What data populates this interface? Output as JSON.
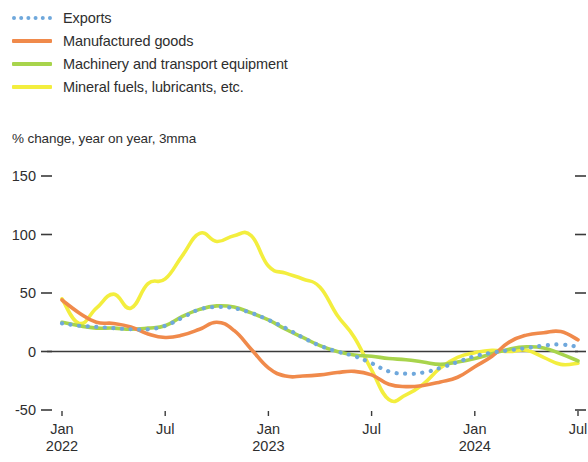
{
  "legend": {
    "items": [
      {
        "label": "Exports",
        "color": "#6FA8DC",
        "style": "dotted"
      },
      {
        "label": "Manufactured goods",
        "color": "#F08A4B",
        "style": "solid"
      },
      {
        "label": "Machinery and transport equipment",
        "color": "#A8D44C",
        "style": "solid"
      },
      {
        "label": "Mineral fuels, lubricants, etc.",
        "color": "#F3EE3E",
        "style": "solid"
      }
    ]
  },
  "subtitle": "% change, year on year, 3mma",
  "axes": {
    "y_ticks": [
      "150",
      "100",
      "50",
      "0",
      "-50"
    ],
    "x_ticks": [
      {
        "month": "Jan",
        "year": "2022"
      },
      {
        "month": "Jul",
        "year": ""
      },
      {
        "month": "Jan",
        "year": "2023"
      },
      {
        "month": "Jul",
        "year": ""
      },
      {
        "month": "Jan",
        "year": "2024"
      },
      {
        "month": "Jul",
        "year": ""
      }
    ]
  },
  "chart_data": {
    "type": "line",
    "title": "",
    "subtitle": "% change, year on year, 3mma",
    "xlabel": "",
    "ylabel": "% change, year on year, 3mma",
    "ylim": [
      -50,
      150
    ],
    "yticks": [
      -50,
      0,
      50,
      100,
      150
    ],
    "grid": false,
    "zero_line": true,
    "legend_position": "top-left",
    "x": [
      "2022-01",
      "2022-02",
      "2022-03",
      "2022-04",
      "2022-05",
      "2022-06",
      "2022-07",
      "2022-08",
      "2022-09",
      "2022-10",
      "2022-11",
      "2022-12",
      "2023-01",
      "2023-02",
      "2023-03",
      "2023-04",
      "2023-05",
      "2023-06",
      "2023-07",
      "2023-08",
      "2023-09",
      "2023-10",
      "2023-11",
      "2023-12",
      "2024-01",
      "2024-02",
      "2024-03",
      "2024-04",
      "2024-05",
      "2024-06",
      "2024-07"
    ],
    "x_tick_labels": [
      "Jan 2022",
      "Jul",
      "Jan 2023",
      "Jul",
      "Jan 2024",
      "Jul"
    ],
    "series": [
      {
        "name": "Exports",
        "color": "#6FA8DC",
        "style": "dotted",
        "values": [
          24,
          22,
          21,
          20,
          19,
          19,
          22,
          29,
          36,
          38,
          37,
          33,
          27,
          20,
          12,
          5,
          0,
          -4,
          -10,
          -17,
          -19,
          -18,
          -14,
          -9,
          -4,
          -1,
          1,
          3,
          5,
          6,
          4
        ]
      },
      {
        "name": "Manufactured goods",
        "color": "#F08A4B",
        "style": "solid",
        "values": [
          44,
          33,
          25,
          24,
          21,
          15,
          12,
          14,
          19,
          25,
          18,
          2,
          -14,
          -21,
          -21,
          -20,
          -18,
          -17,
          -20,
          -28,
          -30,
          -29,
          -26,
          -22,
          -13,
          -4,
          8,
          14,
          16,
          17,
          10
        ]
      },
      {
        "name": "Machinery and transport equipment",
        "color": "#A8D44C",
        "style": "solid",
        "values": [
          25,
          22,
          20,
          20,
          19,
          20,
          22,
          30,
          36,
          39,
          38,
          33,
          27,
          19,
          12,
          5,
          0,
          -3,
          -4,
          -6,
          -7,
          -9,
          -11,
          -9,
          -6,
          -2,
          2,
          4,
          3,
          -2,
          -8
        ]
      },
      {
        "name": "Mineral fuels, lubricants, etc.",
        "color": "#F3EE3E",
        "style": "solid",
        "values": [
          45,
          24,
          37,
          49,
          37,
          58,
          62,
          82,
          101,
          94,
          99,
          99,
          73,
          67,
          62,
          55,
          31,
          12,
          -16,
          -41,
          -37,
          -28,
          -14,
          -5,
          -1,
          1,
          0,
          1,
          -5,
          -11,
          -10
        ]
      }
    ]
  }
}
